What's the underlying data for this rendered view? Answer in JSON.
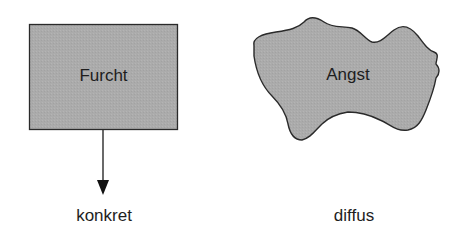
{
  "diagram": {
    "left": {
      "shape_label": "Furcht",
      "caption": "konkret",
      "shape": "rectangle"
    },
    "right": {
      "shape_label": "Angst",
      "caption": "diffus",
      "shape": "irregular-blob"
    },
    "colors": {
      "fill": "#a9a9a9",
      "stroke": "#2a2a2a",
      "text": "#1e1e1e",
      "background": "#ffffff"
    }
  }
}
